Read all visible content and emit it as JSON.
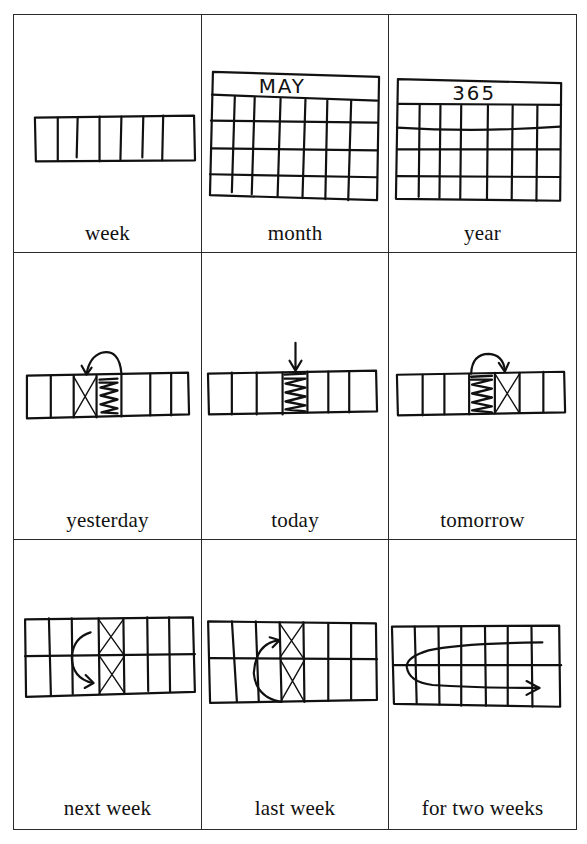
{
  "cards": [
    {
      "id": "week",
      "label": "week",
      "icon": "week-strip-icon"
    },
    {
      "id": "month",
      "label": "month",
      "icon": "month-calendar-icon",
      "header_text": "MAY"
    },
    {
      "id": "year",
      "label": "year",
      "icon": "year-calendar-icon",
      "header_text": "365"
    },
    {
      "id": "yesterday",
      "label": "yesterday",
      "icon": "yesterday-strip-icon"
    },
    {
      "id": "today",
      "label": "today",
      "icon": "today-strip-icon"
    },
    {
      "id": "tomorrow",
      "label": "tomorrow",
      "icon": "tomorrow-strip-icon"
    },
    {
      "id": "next-week",
      "label": "next week",
      "icon": "next-week-grid-icon"
    },
    {
      "id": "last-week",
      "label": "last week",
      "icon": "last-week-grid-icon"
    },
    {
      "id": "for-two-weeks",
      "label": "for two weeks",
      "icon": "two-weeks-grid-icon"
    }
  ],
  "layout": {
    "rows": 3,
    "columns": 3
  },
  "colors": {
    "ink": "#111111",
    "paper": "#ffffff",
    "rule": "#2a2a2a"
  }
}
